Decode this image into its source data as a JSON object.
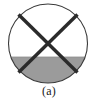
{
  "figure": {
    "caption": "(a)",
    "type": "cross-section-diagram",
    "colors": {
      "outline": "#3a3a3a",
      "cross_line": "#2b2b2b",
      "shade_fill": "#9b9b9b",
      "unshaded_fill": "#ffffff",
      "background": "#ffffff",
      "caption_text": "#1a1a1a"
    },
    "geometry": {
      "circle": {
        "cx": 48,
        "cy": 43.5,
        "r": 39.5,
        "stroke_width": 1
      },
      "fill_level_y": 57,
      "cross": {
        "stroke_width": 3.4,
        "line_a": {
          "x1": 18.5,
          "y1": 14.5,
          "x2": 77.5,
          "y2": 72.5
        },
        "line_b": {
          "x1": 77.5,
          "y1": 14.5,
          "x2": 18.5,
          "y2": 72.5
        }
      }
    }
  }
}
